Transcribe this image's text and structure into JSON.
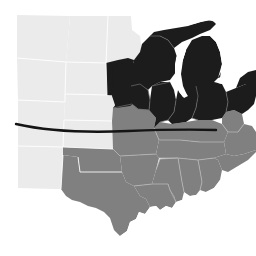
{
  "figure": {
    "type": "choropleth-map",
    "title": "",
    "region": "United States (Central and Midwest)",
    "background_color": "#ffffff",
    "width": 256,
    "height": 256
  },
  "palette": {
    "highlight_dark": "#1c1c1c",
    "mid_gray": "#808080",
    "light_gray": "#ebebeb",
    "border_light": "#ffffff",
    "border_mid": "#b3b3b3",
    "water_white": "#ffffff",
    "overlay_line": "#141414"
  },
  "categories": [
    {
      "key": "dark",
      "label": "Highlighted states",
      "color": "#1c1c1c"
    },
    {
      "key": "mid",
      "label": "Secondary states",
      "color": "#808080"
    },
    {
      "key": "light",
      "label": "Background states",
      "color": "#ebebeb"
    }
  ],
  "states": [
    {
      "name": "Montana",
      "abbr": "MT",
      "category": "light"
    },
    {
      "name": "North Dakota",
      "abbr": "ND",
      "category": "light"
    },
    {
      "name": "South Dakota",
      "abbr": "SD",
      "category": "light"
    },
    {
      "name": "Minnesota",
      "abbr": "MN",
      "category": "light"
    },
    {
      "name": "Wyoming",
      "abbr": "WY",
      "category": "light"
    },
    {
      "name": "Nebraska",
      "abbr": "NE",
      "category": "light"
    },
    {
      "name": "Colorado",
      "abbr": "CO",
      "category": "light"
    },
    {
      "name": "Kansas",
      "abbr": "KS",
      "category": "light"
    },
    {
      "name": "New Mexico",
      "abbr": "NM",
      "category": "light"
    },
    {
      "name": "Iowa",
      "abbr": "IA",
      "category": "dark"
    },
    {
      "name": "Wisconsin",
      "abbr": "WI",
      "category": "dark"
    },
    {
      "name": "Michigan",
      "abbr": "MI",
      "category": "dark"
    },
    {
      "name": "Illinois",
      "abbr": "IL",
      "category": "dark"
    },
    {
      "name": "Indiana",
      "abbr": "IN",
      "category": "dark"
    },
    {
      "name": "Ohio",
      "abbr": "OH",
      "category": "dark"
    },
    {
      "name": "Missouri",
      "abbr": "MO",
      "category": "mid"
    },
    {
      "name": "Oklahoma",
      "abbr": "OK",
      "category": "mid"
    },
    {
      "name": "Texas",
      "abbr": "TX",
      "category": "mid"
    },
    {
      "name": "Arkansas",
      "abbr": "AR",
      "category": "mid"
    },
    {
      "name": "Louisiana",
      "abbr": "LA",
      "category": "mid"
    },
    {
      "name": "Mississippi",
      "abbr": "MS",
      "category": "mid"
    },
    {
      "name": "Alabama",
      "abbr": "AL",
      "category": "mid"
    },
    {
      "name": "Tennessee",
      "abbr": "TN",
      "category": "mid"
    },
    {
      "name": "Kentucky",
      "abbr": "KY",
      "category": "mid"
    },
    {
      "name": "West Virginia",
      "abbr": "WV",
      "category": "mid"
    },
    {
      "name": "Georgia",
      "abbr": "GA",
      "category": "mid"
    },
    {
      "name": "Virginia",
      "abbr": "VA",
      "category": "mid"
    }
  ],
  "water_bodies": [
    {
      "name": "Lake Michigan"
    },
    {
      "name": "Lake Superior"
    },
    {
      "name": "Lake Huron"
    },
    {
      "name": "Lake Erie"
    },
    {
      "name": "Gulf of Mexico"
    }
  ],
  "overlay": {
    "name": "horizontal-route-line",
    "color": "#141414",
    "start_x": 16,
    "start_y": 124,
    "end_x": 216,
    "end_y": 130,
    "stroke_width": 2.4,
    "label": ""
  },
  "annotations": []
}
